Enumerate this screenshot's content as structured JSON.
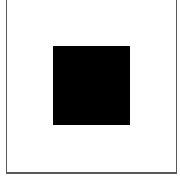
{
  "canvas": {
    "width": 180,
    "height": 179,
    "background": "#ffffff"
  },
  "frame": {
    "border_color": "#5a5a5a"
  },
  "square": {
    "fill": "#000000"
  }
}
